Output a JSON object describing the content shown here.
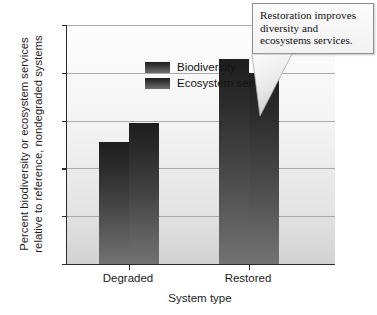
{
  "chart_data": {
    "type": "bar",
    "title": "",
    "subtitle": "",
    "xlabel": "System type",
    "ylabel": "Percent biodiversity or ecosystem services\nrelative to reference, nondegraded systems",
    "categories": [
      "Degraded",
      "Restored"
    ],
    "series": [
      {
        "name": "Biodiversity",
        "values": [
          51,
          86
        ]
      },
      {
        "name": "Ecosystem services",
        "values": [
          59,
          80
        ]
      }
    ],
    "ylim": [
      0,
      100
    ],
    "yticks": [
      0,
      20,
      40,
      60,
      80,
      100
    ],
    "ytick_labels": [
      "0",
      "20",
      "40",
      "60",
      "80",
      "100"
    ],
    "grid": true,
    "grid_axis": "y",
    "legend_position": "top-left-inside",
    "annotations": [
      {
        "name": "restoration-callout",
        "text": "Restoration improves\ndiversity and\necosystems services.",
        "points_at": "Restored Ecosystem services bar"
      }
    ],
    "bar_color": "#3a3a3a",
    "plot_background": "#f0f0f0",
    "axis_color": "#2a2a2a",
    "gridline_color": "#a9a9a9"
  },
  "axis": {
    "y_title": "Percent biodiversity or ecosystem services\nrelative to reference, nondegraded systems",
    "x_title": "System type",
    "y_ticks": [
      "100",
      "80",
      "60",
      "40",
      "20",
      "0"
    ],
    "x_ticks": [
      "Degraded",
      "Restored"
    ]
  },
  "legend": {
    "items": [
      {
        "label": "Biodiversity"
      },
      {
        "label": "Ecosystem services"
      }
    ]
  },
  "callout": {
    "text": "Restoration improves\ndiversity and\necosystems services."
  }
}
